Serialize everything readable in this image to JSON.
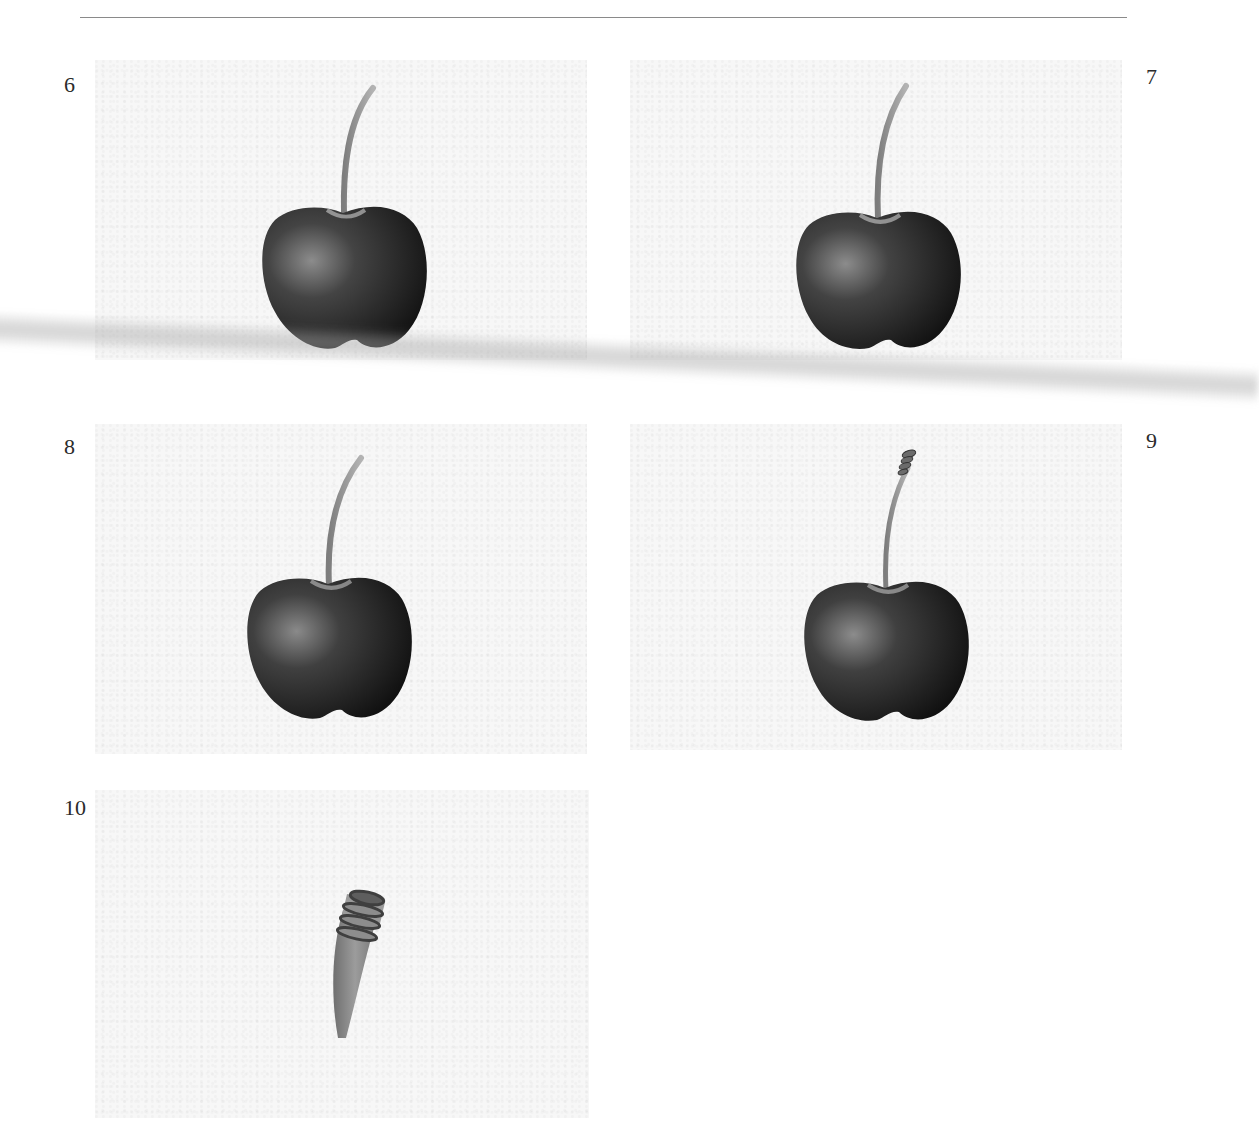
{
  "page": {
    "type": "drawing tutorial page",
    "steps": [
      {
        "number": "6",
        "description": "cherry with smooth stem, shaded body",
        "icon": "cherry-drawing"
      },
      {
        "number": "7",
        "description": "cherry with smooth stem, refined shading",
        "icon": "cherry-drawing"
      },
      {
        "number": "8",
        "description": "cherry with stem, darker shading",
        "icon": "cherry-drawing"
      },
      {
        "number": "9",
        "description": "cherry with ringed stem tip",
        "icon": "cherry-drawing"
      },
      {
        "number": "10",
        "description": "close-up of stem tip with rings",
        "icon": "stem-detail-drawing"
      }
    ]
  },
  "colors": {
    "rule": "#8a8a8a",
    "text": "#2b2b2b",
    "panel_bg": "#f7f7f7",
    "cherry_dark": "#1e1e1e",
    "cherry_highlight": "#8c8c8c",
    "stem": "#9a9a9a"
  }
}
